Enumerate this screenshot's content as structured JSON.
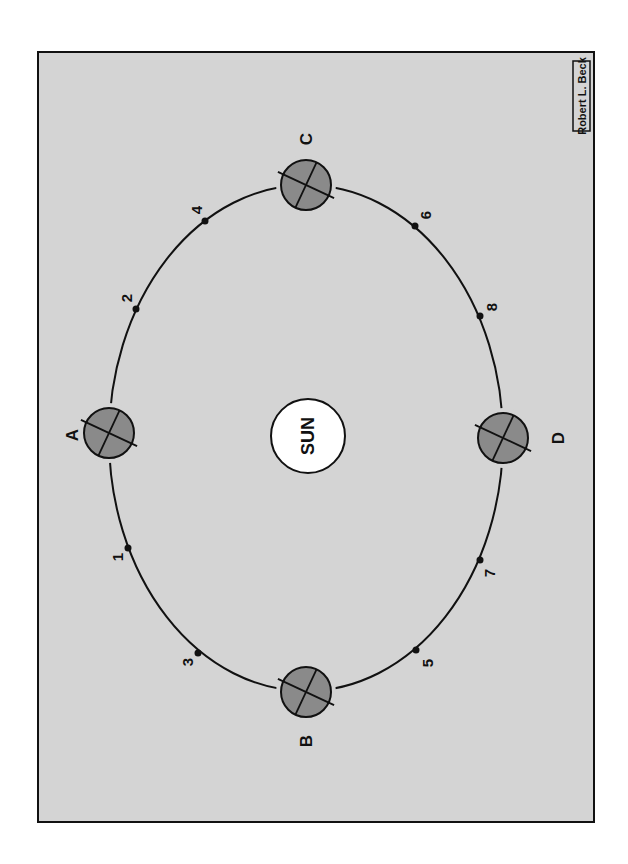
{
  "diagram": {
    "sun": {
      "label": "SUN",
      "cx": 308,
      "cy": 436,
      "rx": 37,
      "ry": 37
    },
    "credit": "Robert L. Beck",
    "colors": {
      "background": "#d4d4d4",
      "frame": "#111111",
      "planet_fill": "#8a8a8a",
      "sun_fill": "#ffffff",
      "orbit": "#111111"
    },
    "orbit": {
      "cx": 306,
      "cy": 438,
      "rx": 197,
      "ry": 253
    },
    "planets": [
      {
        "label": "A",
        "cx": 109,
        "cy": 433,
        "label_x": 72,
        "label_y": 435
      },
      {
        "label": "B",
        "cx": 306,
        "cy": 692,
        "label_x": 306,
        "label_y": 741
      },
      {
        "label": "C",
        "cx": 306,
        "cy": 185,
        "label_x": 306,
        "label_y": 139
      },
      {
        "label": "D",
        "cx": 503,
        "cy": 438,
        "label_x": 558,
        "label_y": 438
      }
    ],
    "positions": [
      {
        "label": "1",
        "x": 128,
        "y": 548,
        "label_x": 117,
        "label_y": 557
      },
      {
        "label": "2",
        "x": 136,
        "y": 309,
        "label_x": 126,
        "label_y": 298
      },
      {
        "label": "3",
        "x": 198,
        "y": 653,
        "label_x": 187,
        "label_y": 662
      },
      {
        "label": "4",
        "x": 205,
        "y": 221,
        "label_x": 196,
        "label_y": 210
      },
      {
        "label": "5",
        "x": 416,
        "y": 650,
        "label_x": 427,
        "label_y": 663
      },
      {
        "label": "6",
        "x": 415,
        "y": 226,
        "label_x": 425,
        "label_y": 215
      },
      {
        "label": "7",
        "x": 480,
        "y": 560,
        "label_x": 489,
        "label_y": 573
      },
      {
        "label": "8",
        "x": 480,
        "y": 316,
        "label_x": 491,
        "label_y": 307
      }
    ]
  }
}
